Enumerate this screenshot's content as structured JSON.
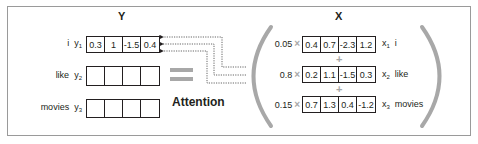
{
  "diagram": {
    "y_header": "Y",
    "x_header": "X",
    "operator_label": "Attention",
    "y_rows": [
      {
        "word": "i",
        "var": "y",
        "sub": "1",
        "values": [
          "0.3",
          "1",
          "-1.5",
          "0.4"
        ]
      },
      {
        "word": "like",
        "var": "y",
        "sub": "2",
        "values": [
          "",
          "",
          "",
          ""
        ]
      },
      {
        "word": "movies",
        "var": "y",
        "sub": "3",
        "values": [
          "",
          "",
          "",
          ""
        ]
      }
    ],
    "x_rows": [
      {
        "weight": "0.05",
        "var": "x",
        "sub": "1",
        "word": "i",
        "values": [
          "0.4",
          "0.7",
          "-2.3",
          "1.2"
        ]
      },
      {
        "weight": "0.8",
        "var": "x",
        "sub": "2",
        "word": "like",
        "values": [
          "0.2",
          "1.1",
          "-1.5",
          "0.3"
        ]
      },
      {
        "weight": "0.15",
        "var": "x",
        "sub": "3",
        "word": "movies",
        "values": [
          "0.7",
          "1.3",
          "0.4",
          "-1.2"
        ]
      }
    ],
    "symbols": {
      "times": "×",
      "plus": "+"
    },
    "colors": {
      "accent_gray": "#a8a8a8",
      "ink": "#231f20",
      "frame": "#9a9a9a"
    }
  }
}
